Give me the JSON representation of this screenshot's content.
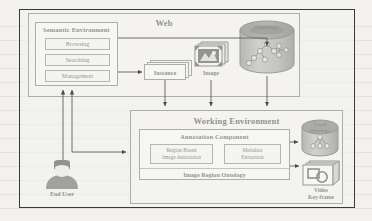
{
  "diagram": {
    "type": "block-diagram"
  },
  "web": {
    "title": "Web",
    "semantic_environment": {
      "title": "Semantic Environment",
      "items": [
        {
          "label": "Browsing"
        },
        {
          "label": "Searching"
        },
        {
          "label": "Management"
        }
      ]
    },
    "instance": {
      "label": "Instance"
    },
    "image": {
      "label": "Image",
      "icon": "image-stack-icon"
    },
    "ontology": {
      "label": "Ontology",
      "icon": "database-cylinder-icon"
    }
  },
  "working_environment": {
    "title": "Working Environment",
    "annotation_component": {
      "title": "Annotation Component",
      "modules": [
        {
          "label": "Region Based\nImage Annotation",
          "line1": "Region Based",
          "line2": "Image Annotation"
        },
        {
          "label": "Metadata\nExtraction",
          "line1": "Metadata",
          "line2": "Extraction"
        }
      ],
      "ontology_bar": {
        "label": "Image Region Ontology"
      }
    },
    "local_ontology": {
      "label": "Local\nOntology",
      "line1": "Local",
      "line2": "Ontology",
      "icon": "database-cylinder-icon"
    },
    "video_keyframe": {
      "label": "Video\nKey-frame",
      "line1": "Video",
      "line2": "Key-frame",
      "icon": "video-stack-icon"
    }
  },
  "actor": {
    "end_user": {
      "label": "End User",
      "icon": "person-icon"
    }
  },
  "colors": {
    "page_background": "#f2f1ee",
    "frame_border": "#3a3a38",
    "box_border": "#5a5a56",
    "box_fill": "#f6f5f2",
    "inner_fill": "#fbfbf9",
    "text": "#14140f",
    "cylinder_dark": "#4d4d4a",
    "cylinder_mid": "#8d8d88",
    "connector": "#5e5e59"
  }
}
